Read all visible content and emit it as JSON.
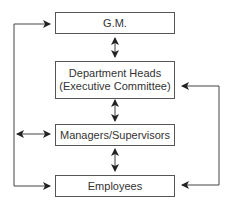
{
  "diagram": {
    "nodes": [
      {
        "id": "gm",
        "label": "G.M."
      },
      {
        "id": "dept",
        "label_line1": "Department Heads",
        "label_line2": "(Executive Committee)"
      },
      {
        "id": "mgr",
        "label": "Managers/Supervisors"
      },
      {
        "id": "emp",
        "label": "Employees"
      }
    ],
    "edges": [
      {
        "from": "gm",
        "to": "dept",
        "type": "bidirectional"
      },
      {
        "from": "dept",
        "to": "mgr",
        "type": "bidirectional"
      },
      {
        "from": "mgr",
        "to": "emp",
        "type": "bidirectional"
      },
      {
        "from": "left-line",
        "to": "gm",
        "type": "arrow"
      },
      {
        "from": "left-line",
        "to": "emp",
        "type": "arrow"
      },
      {
        "from": "left-line",
        "to": "mgr",
        "type": "bidirectional"
      },
      {
        "from": "right-line",
        "to": "dept",
        "type": "arrow"
      },
      {
        "from": "right-line",
        "to": "emp",
        "type": "arrow"
      }
    ],
    "colors": {
      "line": "#444444",
      "box_border": "#555555",
      "text": "#333333"
    }
  }
}
